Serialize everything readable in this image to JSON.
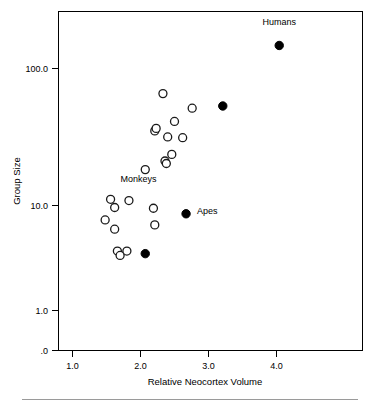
{
  "chart_data": {
    "type": "scatter",
    "title": "",
    "xlabel": "Relative Neocortex Volume",
    "ylabel": "Group Size",
    "xlim": [
      0.82,
      4.45
    ],
    "ylim_log": [
      2.0,
      260.0
    ],
    "yscale": "log",
    "xticks": [
      1.0,
      2.0,
      3.0,
      4.0
    ],
    "xticklabels": [
      "1.0",
      "2.0",
      "3.0",
      "4.0"
    ],
    "yticks": [
      1.0,
      10.0,
      100.0
    ],
    "yticklabels": [
      ".0",
      "1.0",
      "10.0",
      "100.0"
    ],
    "grid": false,
    "legend": "none",
    "annotations": [
      {
        "text": "Humans",
        "x": 4.04,
        "y": 230.0
      },
      {
        "text": "Monkeys",
        "x": 1.97,
        "y": 11.6
      },
      {
        "text": "Apes",
        "x": 2.83,
        "y": 6.3
      }
    ],
    "series": [
      {
        "name": "Monkeys",
        "marker": "open-circle",
        "points": [
          {
            "x": 1.48,
            "y": 5.6
          },
          {
            "x": 1.56,
            "y": 8.3
          },
          {
            "x": 1.62,
            "y": 7.1
          },
          {
            "x": 1.62,
            "y": 4.7
          },
          {
            "x": 1.66,
            "y": 3.1
          },
          {
            "x": 1.7,
            "y": 2.85
          },
          {
            "x": 1.8,
            "y": 3.1
          },
          {
            "x": 1.83,
            "y": 8.1
          },
          {
            "x": 2.07,
            "y": 14.6
          },
          {
            "x": 2.19,
            "y": 7.0
          },
          {
            "x": 2.21,
            "y": 5.1
          },
          {
            "x": 2.21,
            "y": 30.5
          },
          {
            "x": 2.23,
            "y": 32.0
          },
          {
            "x": 2.33,
            "y": 62.0
          },
          {
            "x": 2.36,
            "y": 17.2
          },
          {
            "x": 2.38,
            "y": 16.4
          },
          {
            "x": 2.4,
            "y": 27.2
          },
          {
            "x": 2.46,
            "y": 19.5
          },
          {
            "x": 2.5,
            "y": 36.5
          },
          {
            "x": 2.62,
            "y": 26.8
          },
          {
            "x": 2.76,
            "y": 47.0
          }
        ]
      },
      {
        "name": "Apes and Humans",
        "marker": "filled-circle",
        "points": [
          {
            "x": 2.07,
            "y": 2.95
          },
          {
            "x": 2.67,
            "y": 6.3
          },
          {
            "x": 3.21,
            "y": 49.0
          },
          {
            "x": 4.04,
            "y": 155.0
          }
        ]
      }
    ]
  },
  "axes": {
    "y_title": "Group Size",
    "x_title": "Relative Neocortex Volume",
    "y_tick_100": "100.0",
    "y_tick_10": "10.0",
    "y_tick_1": "1.0",
    "y_tick_0": ".0",
    "x_tick_1": "1.0",
    "x_tick_2": "2.0",
    "x_tick_3": "3.0",
    "x_tick_4": "4.0"
  },
  "labels": {
    "humans": "Humans",
    "monkeys": "Monkeys",
    "apes": "Apes"
  },
  "colors": {
    "frame": "#000000",
    "marker_open_stroke": "#1a1a1a",
    "marker_filled": "#000000",
    "background": "#ffffff",
    "footrule": "#9a9a9a"
  }
}
